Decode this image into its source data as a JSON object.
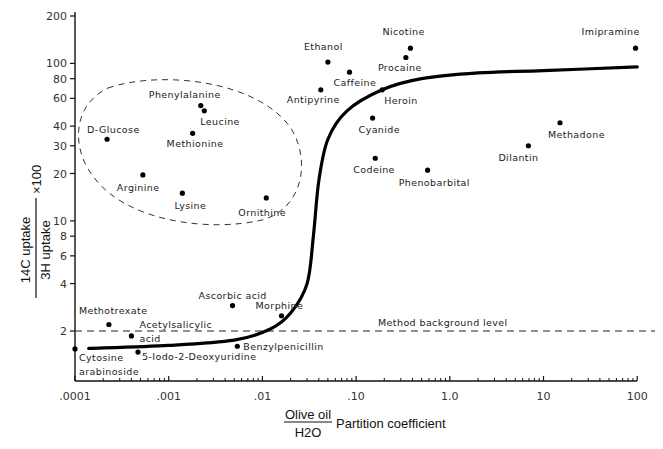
{
  "chart_data": {
    "type": "scatter",
    "title": "",
    "xlabel": "Olive oil / H2O Partition coefficient",
    "xlabel_parts": {
      "numerator": "Olive oil",
      "denominator": "H2O",
      "suffix": "Partition coefficient"
    },
    "ylabel": "14C uptake / 3H uptake × 100",
    "ylabel_parts": {
      "numerator": "14C uptake",
      "denominator": "3H uptake",
      "multiplier": "×100"
    },
    "xscale": "log",
    "yscale": "log",
    "xlim": [
      0.0001,
      100
    ],
    "ylim": [
      1,
      200
    ],
    "grid": false,
    "x_ticks": [
      {
        "value": 0.0001,
        "label": ".0001"
      },
      {
        "value": 0.001,
        "label": ".001"
      },
      {
        "value": 0.01,
        "label": ".01"
      },
      {
        "value": 0.1,
        "label": ".10"
      },
      {
        "value": 1,
        "label": "1.0"
      },
      {
        "value": 10,
        "label": "10"
      },
      {
        "value": 100,
        "label": "100"
      }
    ],
    "y_ticks": [
      {
        "value": 2,
        "label": "2"
      },
      {
        "value": 4,
        "label": "4"
      },
      {
        "value": 6,
        "label": "6"
      },
      {
        "value": 8,
        "label": "8"
      },
      {
        "value": 10,
        "label": "10"
      },
      {
        "value": 20,
        "label": "20"
      },
      {
        "value": 30,
        "label": "30"
      },
      {
        "value": 40,
        "label": "40"
      },
      {
        "value": 60,
        "label": "60"
      },
      {
        "value": 80,
        "label": "80"
      },
      {
        "value": 100,
        "label": "100"
      },
      {
        "value": 200,
        "label": "200"
      }
    ],
    "points": [
      {
        "name": "Cytosine arabinoside",
        "label_lines": [
          "Cytosine",
          "arabinoside"
        ],
        "x": 0.0001,
        "y": 1.54
      },
      {
        "name": "Methotrexate",
        "label_lines": [
          "Methotrexate"
        ],
        "x": 0.00023,
        "y": 2.2
      },
      {
        "name": "Acetylsalicylic acid",
        "label_lines": [
          "Acetylsalicylic",
          "acid"
        ],
        "x": 0.0004,
        "y": 1.86
      },
      {
        "name": "5-Iodo-2-Deoxyuridine",
        "label_lines": [
          "5-Iodo-2-Deoxyuridine"
        ],
        "x": 0.00047,
        "y": 1.47
      },
      {
        "name": "D-Glucose",
        "label_lines": [
          "D-Glucose"
        ],
        "x": 0.00022,
        "y": 33
      },
      {
        "name": "Arginine",
        "label_lines": [
          "Arginine"
        ],
        "x": 0.00053,
        "y": 19.6
      },
      {
        "name": "Lysine",
        "label_lines": [
          "Lysine"
        ],
        "x": 0.0014,
        "y": 15
      },
      {
        "name": "Phenylalanine",
        "label_lines": [
          "Phenylalanine"
        ],
        "x": 0.0022,
        "y": 54
      },
      {
        "name": "Leucine",
        "label_lines": [
          "Leucine"
        ],
        "x": 0.0024,
        "y": 50
      },
      {
        "name": "Methionine",
        "label_lines": [
          "Methionine"
        ],
        "x": 0.0018,
        "y": 36
      },
      {
        "name": "Ornithine",
        "label_lines": [
          "Ornithine"
        ],
        "x": 0.011,
        "y": 14
      },
      {
        "name": "Ascorbic acid",
        "label_lines": [
          "Ascorbic acid"
        ],
        "x": 0.0048,
        "y": 2.9
      },
      {
        "name": "Morphine",
        "label_lines": [
          "Morphine"
        ],
        "x": 0.016,
        "y": 2.5
      },
      {
        "name": "Benzylpenicillin",
        "label_lines": [
          "Benzylpenicillin"
        ],
        "x": 0.0054,
        "y": 1.6
      },
      {
        "name": "Ethanol",
        "label_lines": [
          "Ethanol"
        ],
        "x": 0.05,
        "y": 102
      },
      {
        "name": "Caffeine",
        "label_lines": [
          "Caffeine"
        ],
        "x": 0.085,
        "y": 88
      },
      {
        "name": "Antipyrine",
        "label_lines": [
          "Antipyrine"
        ],
        "x": 0.042,
        "y": 68
      },
      {
        "name": "Nicotine",
        "label_lines": [
          "Nicotine"
        ],
        "x": 0.38,
        "y": 125
      },
      {
        "name": "Procaine",
        "label_lines": [
          "Procaine"
        ],
        "x": 0.34,
        "y": 109
      },
      {
        "name": "Heroin",
        "label_lines": [
          "Heroin"
        ],
        "x": 0.19,
        "y": 68
      },
      {
        "name": "Cyanide",
        "label_lines": [
          "Cyanide"
        ],
        "x": 0.15,
        "y": 45
      },
      {
        "name": "Codeine",
        "label_lines": [
          "Codeine"
        ],
        "x": 0.16,
        "y": 25
      },
      {
        "name": "Phenobarbital",
        "label_lines": [
          "Phenobarbital"
        ],
        "x": 0.58,
        "y": 21
      },
      {
        "name": "Dilantin",
        "label_lines": [
          "Dilantin"
        ],
        "x": 6.9,
        "y": 30
      },
      {
        "name": "Methadone",
        "label_lines": [
          "Methadone"
        ],
        "x": 15,
        "y": 42
      },
      {
        "name": "Imipramine",
        "label_lines": [
          "Imipramine"
        ],
        "x": 96,
        "y": 125
      }
    ],
    "fit_curve": {
      "description": "Sigmoidal trend line (thick solid)",
      "points": [
        {
          "x": 0.00014,
          "y": 1.55
        },
        {
          "x": 0.001,
          "y": 1.62
        },
        {
          "x": 0.005,
          "y": 1.75
        },
        {
          "x": 0.012,
          "y": 2.05
        },
        {
          "x": 0.02,
          "y": 2.6
        },
        {
          "x": 0.03,
          "y": 4
        },
        {
          "x": 0.035,
          "y": 8
        },
        {
          "x": 0.04,
          "y": 18
        },
        {
          "x": 0.05,
          "y": 33
        },
        {
          "x": 0.08,
          "y": 50
        },
        {
          "x": 0.19,
          "y": 68
        },
        {
          "x": 0.5,
          "y": 80
        },
        {
          "x": 2,
          "y": 87
        },
        {
          "x": 10,
          "y": 90
        },
        {
          "x": 100,
          "y": 95
        }
      ]
    },
    "reference_lines": [
      {
        "type": "horizontal",
        "y": 2,
        "style": "dashed",
        "label": "Method background level"
      }
    ],
    "annotations": [
      {
        "type": "ellipse",
        "style": "dashed",
        "encloses": [
          "D-Glucose",
          "Phenylalanine",
          "Leucine",
          "Methionine",
          "Arginine",
          "Lysine",
          "Ornithine"
        ]
      }
    ]
  }
}
